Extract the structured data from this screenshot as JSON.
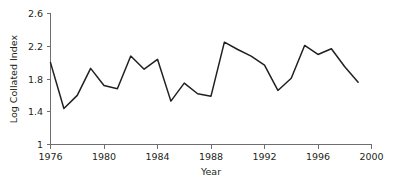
{
  "chart_data": {
    "type": "line",
    "title": "",
    "xlabel": "Year",
    "ylabel": "Log Collated Index",
    "xlim": [
      1976,
      2000
    ],
    "ylim": [
      1.0,
      2.6
    ],
    "grid": false,
    "legend": "none",
    "xticks": [
      1976,
      1980,
      1984,
      1988,
      1992,
      1996,
      2000
    ],
    "xtick_labels": [
      "1976",
      "1980",
      "1984",
      "1988",
      "1992",
      "1996",
      "2000"
    ],
    "yticks": [
      1,
      1.4,
      1.8,
      2.2,
      2.6
    ],
    "ytick_labels": [
      "1",
      "1.4",
      "1.8",
      "2.2",
      "2.6"
    ],
    "series": [
      {
        "name": "Log Collated Index",
        "color": "#231f20",
        "x": [
          1976,
          1977,
          1978,
          1979,
          1980,
          1981,
          1982,
          1983,
          1984,
          1985,
          1986,
          1987,
          1988,
          1989,
          1990,
          1991,
          1992,
          1993,
          1994,
          1995,
          1996,
          1997,
          1998,
          1999
        ],
        "values": [
          2.0,
          1.44,
          1.6,
          1.93,
          1.72,
          1.68,
          2.08,
          1.92,
          2.04,
          1.53,
          1.75,
          1.62,
          1.59,
          2.25,
          2.16,
          2.08,
          1.97,
          1.66,
          1.81,
          2.21,
          2.1,
          2.17,
          1.95,
          1.76
        ]
      }
    ]
  },
  "axes": {
    "x_axis_label": "Year",
    "y_axis_label": "Log Collated Index"
  },
  "colors": {
    "line": "#231f20",
    "axis": "#6d6e70",
    "text": "#231f20",
    "background": "#ffffff"
  }
}
